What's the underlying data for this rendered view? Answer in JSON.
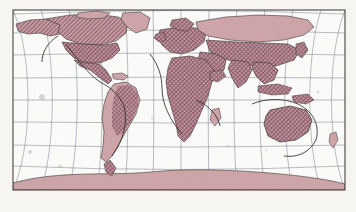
{
  "figure": {
    "kind": "world-map",
    "title": "World distribution map",
    "projection": "curved-graticule pseudocylindrical (Robinson / Winkel-Tripel style)",
    "medium": "scanned printed figure",
    "caption": "",
    "labels": []
  },
  "canvas": {
    "width": 356,
    "height": 212,
    "page_background": "#f7f5f2",
    "ocean_background": "#fbfbfa"
  },
  "frame": {
    "name": "map-neatline",
    "x": 13,
    "y": 10,
    "width": 332,
    "height": 180,
    "stroke": "#4a4542",
    "stroke_width": 1.1
  },
  "graticule": {
    "stroke": "#6b6f7d",
    "stroke_width": 0.55,
    "opacity": 0.85,
    "meridian_spacing_deg": 30,
    "parallel_spacing_deg": 20,
    "meridian_count": 13,
    "parallel_count": 9,
    "central_meridian_deg": 10,
    "equator_label": "equator",
    "notes": "meridians curve outward from the central meridian; parallels bow toward the poles"
  },
  "symbology": {
    "land_outline": "#3a3330",
    "land_outline_width": 0.6,
    "range_fill_light": "#cda4a8",
    "range_fill_dark": "#a9727a",
    "hatch_color": "#6f4048",
    "hatch_angle_deg": 45,
    "hatch_spacing_px": 2,
    "unshaded_land": "#ffffff",
    "scan_speckle": "#b9b2ad"
  },
  "legend": {
    "visible": false,
    "entries": [
      {
        "label": "dense / continuous range",
        "swatch": "#a9727a",
        "pattern": "cross-hatch"
      },
      {
        "label": "sparse / marginal range",
        "swatch": "#cda4a8",
        "pattern": "solid tint"
      }
    ]
  },
  "regions": [
    {
      "name": "north-america",
      "shading": "dark-hatch",
      "shaded": true
    },
    {
      "name": "greenland",
      "shading": "light-tint",
      "shaded": true
    },
    {
      "name": "central-america",
      "shading": "dark-hatch",
      "shaded": true
    },
    {
      "name": "south-america",
      "shading": "mixed",
      "shaded": true
    },
    {
      "name": "europe",
      "shading": "dark-hatch",
      "shaded": true
    },
    {
      "name": "africa",
      "shading": "dark-hatch",
      "shaded": true
    },
    {
      "name": "madagascar",
      "shading": "light-tint",
      "shaded": true
    },
    {
      "name": "northern-asia",
      "shading": "light-tint",
      "shaded": true
    },
    {
      "name": "southern-asia",
      "shading": "dark-hatch",
      "shaded": true
    },
    {
      "name": "southeast-asia",
      "shading": "dark-hatch",
      "shaded": true
    },
    {
      "name": "japan",
      "shading": "dark-hatch",
      "shaded": true
    },
    {
      "name": "australia",
      "shading": "dark-hatch",
      "shaded": true
    },
    {
      "name": "new-zealand",
      "shading": "light-tint",
      "shaded": true
    },
    {
      "name": "antarctica",
      "shading": "light-tint",
      "shaded": true
    }
  ]
}
